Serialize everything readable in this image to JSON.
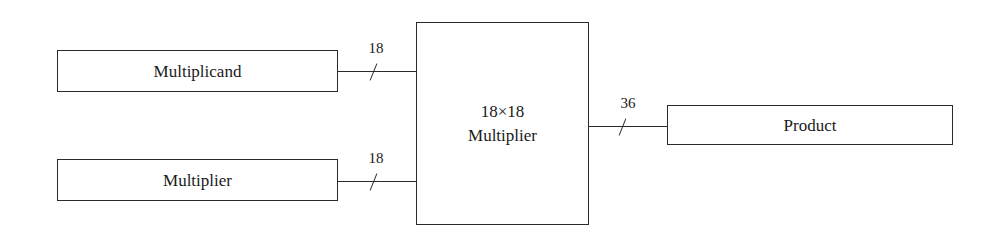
{
  "diagram": {
    "type": "block-diagram",
    "nodes": [
      {
        "id": "multiplicand",
        "label": "Multiplicand"
      },
      {
        "id": "multiplier_in",
        "label": "Multiplier"
      },
      {
        "id": "core",
        "label_line1": "18×18",
        "label_line2": "Multiplier"
      },
      {
        "id": "product",
        "label": "Product"
      }
    ],
    "edges": [
      {
        "from": "multiplicand",
        "to": "core",
        "bus_width": "18"
      },
      {
        "from": "multiplier_in",
        "to": "core",
        "bus_width": "18"
      },
      {
        "from": "core",
        "to": "product",
        "bus_width": "36"
      }
    ]
  },
  "colors": {
    "stroke": "#2a2a2a",
    "background": "#ffffff"
  }
}
